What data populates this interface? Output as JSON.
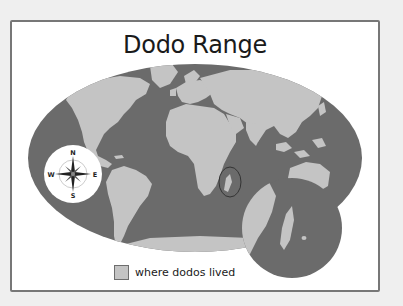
{
  "map": {
    "title": "Dodo Range",
    "projection": "world-ellipse",
    "colors": {
      "ocean": "#6b6b6b",
      "land": "#c4c4c4",
      "frame": "#777777",
      "background": "#ffffff",
      "page": "#efefef"
    },
    "compass": {
      "north": "N",
      "east": "E",
      "south": "S",
      "west": "W"
    },
    "highlight": {
      "region": "Madagascar",
      "inset": "magnified view of Madagascar and Mascarene Islands"
    },
    "legend": {
      "items": [
        {
          "label": "where dodos lived",
          "color": "#c4c4c4"
        }
      ]
    }
  }
}
